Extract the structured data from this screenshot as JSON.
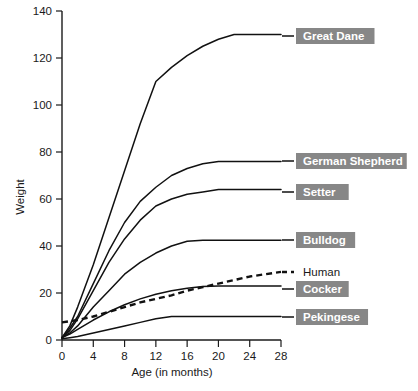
{
  "chart_data": {
    "type": "line",
    "title": "",
    "xlabel": "Age (in months)",
    "ylabel": "Weight",
    "xlim": [
      0,
      28
    ],
    "ylim": [
      0,
      140
    ],
    "xticks": [
      0,
      4,
      8,
      12,
      16,
      20,
      24,
      28
    ],
    "yticks": [
      0,
      20,
      40,
      60,
      80,
      100,
      120,
      140
    ],
    "grid": false,
    "legend_position": "right-inline-labels",
    "series": [
      {
        "name": "Great Dane",
        "style": "solid",
        "color": "#111111",
        "label_boxed": true,
        "x": [
          0,
          1,
          2,
          4,
          6,
          8,
          10,
          12,
          14,
          16,
          18,
          20,
          22,
          24,
          26,
          28
        ],
        "y": [
          1,
          6,
          14,
          32,
          52,
          72,
          92,
          110,
          116,
          121,
          125,
          128,
          130,
          130,
          130,
          130
        ]
      },
      {
        "name": "German Shepherd",
        "style": "solid",
        "color": "#111111",
        "label_boxed": true,
        "x": [
          0,
          1,
          2,
          4,
          6,
          8,
          10,
          12,
          14,
          16,
          18,
          20,
          22,
          24,
          26,
          28
        ],
        "y": [
          1,
          5,
          10,
          24,
          38,
          50,
          59,
          65,
          70,
          73,
          75,
          76,
          76,
          76,
          76,
          76
        ]
      },
      {
        "name": "Setter",
        "style": "solid",
        "color": "#111111",
        "label_boxed": true,
        "x": [
          0,
          1,
          2,
          4,
          6,
          8,
          10,
          12,
          14,
          16,
          18,
          20,
          22,
          24,
          26,
          28
        ],
        "y": [
          1,
          4,
          9,
          21,
          33,
          43,
          51,
          57,
          60,
          62,
          63,
          64,
          64,
          64,
          64,
          64
        ]
      },
      {
        "name": "Bulldog",
        "style": "solid",
        "color": "#111111",
        "label_boxed": true,
        "x": [
          0,
          1,
          2,
          4,
          6,
          8,
          10,
          12,
          14,
          16,
          18,
          20,
          22,
          24,
          26,
          28
        ],
        "y": [
          1,
          3,
          6,
          14,
          21,
          28,
          33,
          37,
          40,
          42,
          42.5,
          42.5,
          42.5,
          42.5,
          42.5,
          42.5
        ]
      },
      {
        "name": "Human",
        "style": "dashed",
        "color": "#111111",
        "label_boxed": false,
        "x": [
          0,
          1,
          2,
          4,
          6,
          8,
          10,
          12,
          14,
          16,
          18,
          20,
          22,
          24,
          26,
          28
        ],
        "y": [
          7.5,
          8,
          8.5,
          10,
          12,
          14,
          16,
          17.5,
          19,
          21,
          22.5,
          24,
          25.5,
          27,
          28,
          29
        ]
      },
      {
        "name": "Cocker",
        "style": "solid",
        "color": "#111111",
        "label_boxed": true,
        "x": [
          0,
          1,
          2,
          4,
          6,
          8,
          10,
          12,
          14,
          16,
          18,
          20,
          22,
          24,
          26,
          28
        ],
        "y": [
          1,
          2.5,
          4.5,
          8.5,
          12,
          15,
          17.5,
          19.5,
          21,
          22,
          22.8,
          23,
          23,
          23,
          23,
          23
        ]
      },
      {
        "name": "Pekingese",
        "style": "solid",
        "color": "#111111",
        "label_boxed": true,
        "x": [
          0,
          1,
          2,
          4,
          6,
          8,
          10,
          12,
          14,
          16,
          18,
          20,
          22,
          24,
          26,
          28
        ],
        "y": [
          0.5,
          1,
          1.5,
          3,
          4.5,
          6,
          7.5,
          9,
          10,
          10,
          10,
          10,
          10,
          10,
          10,
          10
        ]
      }
    ]
  },
  "axes": {
    "y_title": "Weight",
    "x_title": "Age (in months)",
    "y_tick_labels": [
      "0",
      "20",
      "40",
      "60",
      "80",
      "100",
      "120",
      "140"
    ],
    "x_tick_labels": [
      "0",
      "4",
      "8",
      "12",
      "16",
      "20",
      "24",
      "28"
    ]
  },
  "legend": {
    "box_color": "#878787",
    "text_color": "#ffffff",
    "items": [
      {
        "label": "Great Dane",
        "boxed": true,
        "dashed": false
      },
      {
        "label": "German Shepherd",
        "boxed": true,
        "dashed": false
      },
      {
        "label": "Setter",
        "boxed": true,
        "dashed": false
      },
      {
        "label": "Bulldog",
        "boxed": true,
        "dashed": false
      },
      {
        "label": "Human",
        "boxed": false,
        "dashed": true
      },
      {
        "label": "Cocker",
        "boxed": true,
        "dashed": false
      },
      {
        "label": "Pekingese",
        "boxed": true,
        "dashed": false
      }
    ]
  }
}
